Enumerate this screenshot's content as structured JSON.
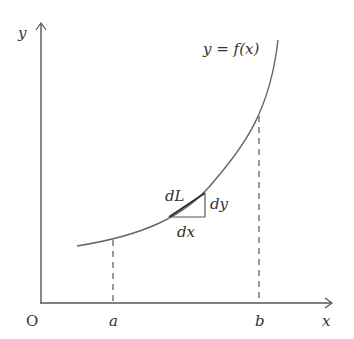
{
  "diagram": {
    "axes": {
      "x_label": "x",
      "y_label": "y",
      "origin_label": "O"
    },
    "curve_label": "y = f(x)",
    "interval": {
      "start_label": "a",
      "end_label": "b"
    },
    "element": {
      "arc_label": "dL",
      "dx_label": "dx",
      "dy_label": "dy"
    },
    "colors": {
      "line": "#555555",
      "text": "#333333"
    }
  }
}
